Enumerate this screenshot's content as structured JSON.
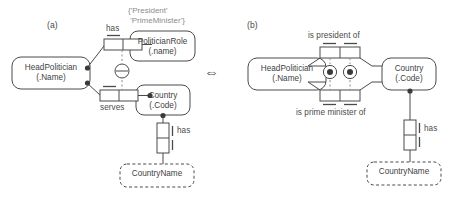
{
  "figure": {
    "type": "orm-diagram",
    "panels": [
      {
        "tag": "(a)",
        "annotation": "{'President'\n 'PrimeMinister'}",
        "entities": [
          {
            "name": "HeadPolitician",
            "ref": "(.Name)",
            "kind": "entity-type"
          },
          {
            "name": "PoliticianRole",
            "ref": "(.name)",
            "kind": "entity-type"
          },
          {
            "name": "Country",
            "ref": "(.Code)",
            "kind": "entity-type"
          },
          {
            "name": "CountryName",
            "ref": "",
            "kind": "value-type"
          }
        ],
        "predicates": [
          {
            "label": "has",
            "cells": 2,
            "orientation": "horizontal"
          },
          {
            "label": "serves",
            "cells": 2,
            "orientation": "horizontal"
          },
          {
            "label": "has",
            "cells": 2,
            "orientation": "vertical"
          }
        ],
        "constraints": [
          {
            "kind": "exclusion",
            "glyph": "circle-with-bar"
          }
        ]
      },
      {
        "tag": "(b)",
        "annotation": "",
        "entities": [
          {
            "name": "HeadPolitician",
            "ref": "(.Name)",
            "kind": "entity-type"
          },
          {
            "name": "Country",
            "ref": "(.Code)",
            "kind": "entity-type"
          },
          {
            "name": "CountryName",
            "ref": "",
            "kind": "value-type"
          }
        ],
        "predicates": [
          {
            "label": "is president of",
            "cells": 2,
            "orientation": "horizontal"
          },
          {
            "label": "is prime minister of",
            "cells": 2,
            "orientation": "horizontal"
          },
          {
            "label": "has",
            "cells": 2,
            "orientation": "vertical"
          }
        ],
        "constraints": [
          {
            "kind": "mandatory-ring",
            "glyph": "circle-with-dot"
          },
          {
            "kind": "mandatory-ring",
            "glyph": "circle-with-dot"
          }
        ]
      }
    ],
    "equivalence_symbol": "⇔",
    "colors": {
      "stroke": "#4a4a4a",
      "text": "#3f3f3f",
      "annotation": "#8d8d8d",
      "background": "#ffffff"
    }
  },
  "panel_a": {
    "tag": "(a)",
    "annotation_line1": "{'President'",
    "annotation_line2": " 'PrimeMinister'}",
    "entity_headpolitician_l1": "HeadPolitician",
    "entity_headpolitician_l2": "(.Name)",
    "entity_politicianrole_l1": "PoliticianRole",
    "entity_politicianrole_l2": "(.name)",
    "entity_country_l1": "Country",
    "entity_country_l2": "(.Code)",
    "value_countryname": "CountryName",
    "predicate_has_top": "has",
    "predicate_serves": "serves",
    "predicate_has_bottom": "has"
  },
  "panel_b": {
    "tag": "(b)",
    "entity_headpolitician_l1": "HeadPolitician",
    "entity_headpolitician_l2": "(.Name)",
    "entity_country_l1": "Country",
    "entity_country_l2": "(.Code)",
    "value_countryname": "CountryName",
    "predicate_is_president_of": "is president of",
    "predicate_is_prime_minister_of": "is prime minister of",
    "predicate_has": "has"
  },
  "equivalence": {
    "symbol": "⇔"
  }
}
